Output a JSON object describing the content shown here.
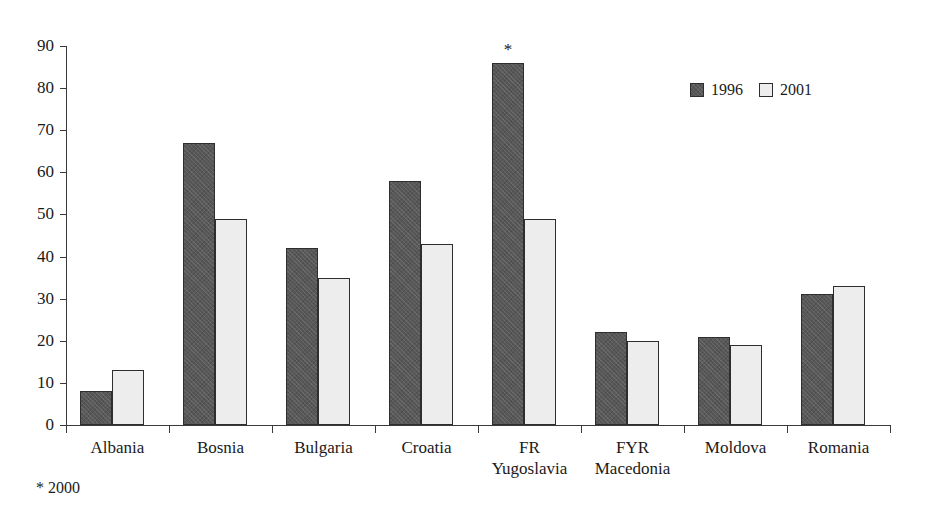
{
  "chart_data": {
    "type": "bar",
    "title": "",
    "subtitle": "",
    "xlabel": "",
    "ylabel": "",
    "ylim": [
      0,
      90
    ],
    "ytick_step": 10,
    "yticks": [
      0,
      10,
      20,
      30,
      40,
      50,
      60,
      70,
      80,
      90
    ],
    "grid": false,
    "legend_position": "top-right",
    "categories": [
      "Albania",
      "Bosnia",
      "Bulgaria",
      "Croatia",
      "FR Yugoslavia",
      "FYR Macedonia",
      "Moldova",
      "Romania"
    ],
    "category_lines": [
      [
        "Albania",
        ""
      ],
      [
        "Bosnia",
        ""
      ],
      [
        "Bulgaria",
        ""
      ],
      [
        "Croatia",
        ""
      ],
      [
        "FR",
        "Yugoslavia"
      ],
      [
        "FYR",
        "Macedonia"
      ],
      [
        "Moldova",
        ""
      ],
      [
        "Romania",
        ""
      ]
    ],
    "series": [
      {
        "name": "1996",
        "color": "#585858",
        "values": [
          8,
          67,
          42,
          58,
          86,
          22,
          21,
          31
        ]
      },
      {
        "name": "2001",
        "color": "#ededed",
        "values": [
          13,
          49,
          35,
          43,
          49,
          20,
          19,
          33
        ]
      }
    ],
    "annotations": [
      {
        "text": "*",
        "category": "FR Yugoslavia",
        "series": "1996",
        "value": 86
      }
    ],
    "footnote": "* 2000"
  },
  "legend": {
    "items": [
      {
        "label": "1996",
        "swatch": "dark-hatched-square"
      },
      {
        "label": "2001",
        "swatch": "light-outlined-square"
      }
    ]
  },
  "colors": {
    "series_1996": "#585858",
    "series_2001": "#ededed",
    "bar_outline": "#2e2e2e",
    "axis": "#3a3a3a",
    "text": "#1a1a1a",
    "background": "#ffffff"
  }
}
